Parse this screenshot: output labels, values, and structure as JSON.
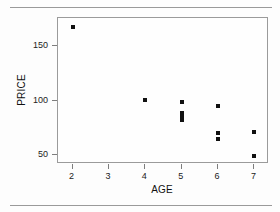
{
  "chart_data": {
    "type": "scatter",
    "title": "",
    "xlabel": "AGE",
    "ylabel": "PRICE",
    "xlim": [
      1.6,
      7.4
    ],
    "ylim": [
      42,
      176
    ],
    "xticks": [
      2,
      3,
      4,
      5,
      6,
      7
    ],
    "yticks": [
      50,
      100,
      150
    ],
    "xtick_labels": [
      "2",
      "3",
      "4",
      "5",
      "6",
      "7"
    ],
    "ytick_labels": [
      "50",
      "100",
      "150"
    ],
    "grid": false,
    "legend": false,
    "marker": "filled-square",
    "marker_color": "#111111",
    "frame_color": "#9b9b9b",
    "points": [
      {
        "x": 2,
        "y": 168
      },
      {
        "x": 4,
        "y": 101
      },
      {
        "x": 5,
        "y": 99
      },
      {
        "x": 5,
        "y": 89
      },
      {
        "x": 5,
        "y": 85
      },
      {
        "x": 5,
        "y": 82
      },
      {
        "x": 6,
        "y": 95
      },
      {
        "x": 6,
        "y": 70
      },
      {
        "x": 6,
        "y": 65
      },
      {
        "x": 7,
        "y": 71
      },
      {
        "x": 7,
        "y": 49
      }
    ]
  },
  "figure": {
    "rule_color": "#9a9a9a",
    "background": "#fdfdfd"
  }
}
